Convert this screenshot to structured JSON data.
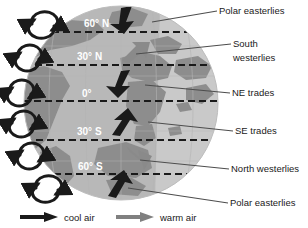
{
  "diagram": {
    "globe": {
      "ocean_color": "#c9c9c9",
      "land_color": "#8e8e8e",
      "shadow_color": "#7d7d7d",
      "latitude_lines": [
        {
          "id": "lat-60n",
          "label": "60° N"
        },
        {
          "id": "lat-30n",
          "label": "30° N"
        },
        {
          "id": "lat-0",
          "label": "0°"
        },
        {
          "id": "lat-30s",
          "label": "30° S"
        },
        {
          "id": "lat-60s",
          "label": "60° S"
        }
      ]
    },
    "wind_labels": [
      {
        "id": "polar-easterlies-north",
        "text": "Polar easterlies"
      },
      {
        "id": "south-westerlies-line1",
        "text": "South"
      },
      {
        "id": "south-westerlies-line2",
        "text": "westerlies"
      },
      {
        "id": "ne-trades",
        "text": "NE trades"
      },
      {
        "id": "se-trades",
        "text": "SE trades"
      },
      {
        "id": "north-westerlies",
        "text": "North westerlies"
      },
      {
        "id": "polar-easterlies-south",
        "text": "Polar easterlies"
      }
    ],
    "legend": {
      "items": [
        {
          "id": "cool-air",
          "label": "cool air",
          "color": "#1a1a1a"
        },
        {
          "id": "warm-air",
          "label": "warm air",
          "color": "#808080"
        }
      ]
    },
    "circulation_cells": {
      "count": 6,
      "arrow_color": "#1a1a1a",
      "description": "Six circular convection cell arrows along the left limb of the globe"
    },
    "surface_wind_arrows": {
      "cool_color": "#1a1a1a",
      "warm_color": "#8a8a8a",
      "count": 6
    }
  }
}
